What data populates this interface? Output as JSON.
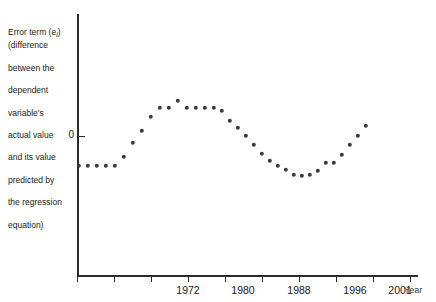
{
  "chart_data": {
    "type": "scatter",
    "title": "",
    "subtitle": "",
    "ylabel": "Error term (e_i) (difference between the dependent variable's actual value and its value predicted by the regression equation)",
    "ylabel_lines": [
      "Error term (e",
      ") (difference",
      "between the",
      "dependent",
      "variable's",
      "actual value",
      "and its value",
      "predicted by",
      "the regression",
      "equation)"
    ],
    "ylabel_subscript": "i",
    "xlabel": "Year",
    "y_tick_labels": [
      "0"
    ],
    "y_zero_label": "0",
    "grid": false,
    "legend": null,
    "xlim": [
      1968,
      2005
    ],
    "ylim": [
      -1.35,
      1.35
    ],
    "x_tick_labels": [
      "1972",
      "1980",
      "1988",
      "1996",
      "2001"
    ],
    "x_tick_values": [
      1972,
      1980,
      1988,
      1996,
      2001
    ],
    "minor_tick_values": [
      1968,
      1972,
      1976,
      1980,
      1984,
      1988,
      1992,
      1996,
      2000
    ],
    "series": [
      {
        "name": "Error term",
        "marker": "circle",
        "color": "#3a3a3a",
        "x": [
          1968.0,
          1968.9,
          1969.8,
          1970.7,
          1971.6,
          1972.5,
          1973.4,
          1974.3,
          1975.2,
          1976.1,
          1977.0,
          1977.9,
          1978.8,
          1979.7,
          1980.6,
          1981.5,
          1982.4,
          1983.3,
          1984.2,
          1985.1,
          1986.0,
          1986.9,
          1987.8,
          1988.7,
          1989.6,
          1990.5,
          1991.4,
          1992.3,
          1993.2,
          1994.1,
          1995.0,
          1995.9,
          1996.8,
          1997.7,
          1998.6,
          1999.5,
          2000.4,
          2001.3,
          2002.2,
          2003.1,
          2004.0
        ],
        "y": [
          -0.44,
          -0.44,
          -0.44,
          -0.44,
          -0.44,
          -0.3,
          -0.07,
          0.16,
          0.36,
          0.47,
          0.47,
          0.56,
          0.47,
          0.47,
          0.47,
          0.47,
          0.47,
          0.42,
          0.24,
          0.14,
          0.04,
          -0.08,
          -0.25,
          -0.4,
          -0.45,
          -0.52,
          -0.55,
          -0.52,
          -0.44,
          -0.28,
          -0.28,
          -0.12,
          0.06,
          0.2,
          0.3,
          0.47,
          0.47,
          0.47,
          0.56,
          0.47,
          0.47
        ]
      }
    ],
    "note": "Cyclical residual pattern: flat negative run, rise to first plateau, decline to trough, rise to second plateau, then steep decline."
  },
  "points": [
    {
      "x": 79,
      "y": 166
    },
    {
      "x": 88,
      "y": 166
    },
    {
      "x": 97,
      "y": 166
    },
    {
      "x": 106,
      "y": 166
    },
    {
      "x": 115,
      "y": 166
    },
    {
      "x": 104,
      "y": 166
    },
    {
      "x": 113,
      "y": 156
    },
    {
      "x": 122,
      "y": 143
    },
    {
      "x": 131,
      "y": 129
    },
    {
      "x": 140,
      "y": 113
    },
    {
      "x": 149,
      "y": 107
    },
    {
      "x": 158,
      "y": 107
    },
    {
      "x": 167,
      "y": 101
    },
    {
      "x": 176,
      "y": 107
    },
    {
      "x": 185,
      "y": 107
    },
    {
      "x": 194,
      "y": 107
    },
    {
      "x": 203,
      "y": 107
    },
    {
      "x": 211,
      "y": 107
    },
    {
      "x": 219,
      "y": 110
    },
    {
      "x": 228,
      "y": 121
    },
    {
      "x": 237,
      "y": 127
    },
    {
      "x": 246,
      "y": 133
    },
    {
      "x": 254,
      "y": 141
    },
    {
      "x": 262,
      "y": 150
    },
    {
      "x": 270,
      "y": 160
    },
    {
      "x": 278,
      "y": 163
    },
    {
      "x": 286,
      "y": 166
    },
    {
      "x": 294,
      "y": 171
    },
    {
      "x": 302,
      "y": 175
    },
    {
      "x": 310,
      "y": 176
    },
    {
      "x": 318,
      "y": 171
    },
    {
      "x": 326,
      "y": 166
    },
    {
      "x": 334,
      "y": 163
    },
    {
      "x": 310,
      "y": 163
    },
    {
      "x": 318,
      "y": 160
    },
    {
      "x": 326,
      "y": 152
    },
    {
      "x": 334,
      "y": 145
    },
    {
      "x": 342,
      "y": 138
    },
    {
      "x": 350,
      "y": 130
    },
    {
      "x": 358,
      "y": 124
    },
    {
      "x": 366,
      "y": 118
    }
  ],
  "plot_points": [
    {
      "x": 79,
      "y": 166
    },
    {
      "x": 88,
      "y": 166
    },
    {
      "x": 97,
      "y": 166
    },
    {
      "x": 106,
      "y": 166
    },
    {
      "x": 115,
      "y": 166
    },
    {
      "x": 124,
      "y": 157
    },
    {
      "x": 133,
      "y": 143
    },
    {
      "x": 142,
      "y": 131
    },
    {
      "x": 151,
      "y": 117
    },
    {
      "x": 160,
      "y": 108
    },
    {
      "x": 169,
      "y": 108
    },
    {
      "x": 178,
      "y": 101
    },
    {
      "x": 187,
      "y": 108
    },
    {
      "x": 196,
      "y": 108
    },
    {
      "x": 205,
      "y": 108
    },
    {
      "x": 214,
      "y": 108
    },
    {
      "x": 222,
      "y": 111
    },
    {
      "x": 230,
      "y": 121
    },
    {
      "x": 238,
      "y": 128
    },
    {
      "x": 246,
      "y": 136
    },
    {
      "x": 254,
      "y": 145
    },
    {
      "x": 262,
      "y": 154
    },
    {
      "x": 270,
      "y": 161
    },
    {
      "x": 278,
      "y": 166
    },
    {
      "x": 286,
      "y": 170
    },
    {
      "x": 294,
      "y": 175
    },
    {
      "x": 302,
      "y": 176
    },
    {
      "x": 310,
      "y": 175
    },
    {
      "x": 318,
      "y": 171
    },
    {
      "x": 326,
      "y": 163
    },
    {
      "x": 334,
      "y": 163
    },
    {
      "x": 342,
      "y": 155
    },
    {
      "x": 350,
      "y": 145
    },
    {
      "x": 358,
      "y": 136
    },
    {
      "x": 366,
      "y": 126
    }
  ],
  "axes": {
    "y_axis_x": 77,
    "y_axis_top": 14,
    "y_axis_bottom": 276,
    "x_axis_y": 275,
    "x_axis_left": 77,
    "x_axis_right": 418,
    "zero_y": 136
  },
  "ticks": [
    {
      "px": 77,
      "label": ""
    },
    {
      "px": 114,
      "label": ""
    },
    {
      "px": 151,
      "label": "1972"
    },
    {
      "px": 188,
      "label": ""
    },
    {
      "px": 225,
      "label": "1980"
    },
    {
      "px": 262,
      "label": ""
    },
    {
      "px": 299,
      "label": "1988"
    },
    {
      "px": 336,
      "label": ""
    },
    {
      "px": 373,
      "label": "1996"
    },
    {
      "px": 410,
      "label": ""
    }
  ],
  "tick_labels": [
    {
      "px": 188,
      "text": "1972"
    },
    {
      "px": 243,
      "text": "1980"
    },
    {
      "px": 299,
      "text": "1988"
    },
    {
      "px": 355,
      "text": "1996"
    },
    {
      "px": 400,
      "text": "2001"
    }
  ],
  "colors": {
    "marker": "#3a3a3a",
    "axis": "#2b2b2b",
    "text": "#1a1a1a",
    "background": "#ffffff"
  }
}
